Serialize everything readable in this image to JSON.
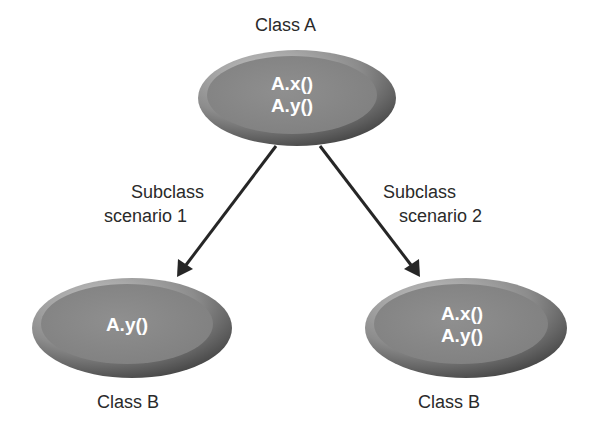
{
  "diagram": {
    "nodes": [
      {
        "id": "class-a",
        "title": "Class A",
        "methods": [
          "A.x()",
          "A.y()"
        ]
      },
      {
        "id": "class-b-scenario-1",
        "title": "Class B",
        "methods": [
          "A.y()"
        ]
      },
      {
        "id": "class-b-scenario-2",
        "title": "Class B",
        "methods": [
          "A.x()",
          "A.y()"
        ]
      }
    ],
    "edges": [
      {
        "from": "class-a",
        "to": "class-b-scenario-1",
        "label_line1": "Subclass",
        "label_line2": "scenario 1"
      },
      {
        "from": "class-a",
        "to": "class-b-scenario-2",
        "label_line1": "Subclass",
        "label_line2": "scenario 2"
      }
    ]
  },
  "colors": {
    "ellipse_outer_dark": "#4a4a4a",
    "ellipse_outer_light": "#b5b5b5",
    "ellipse_inner": "#8a8a8a",
    "arrow": "#262626",
    "text_dark": "#2a2a2a",
    "text_light": "#ffffff"
  }
}
